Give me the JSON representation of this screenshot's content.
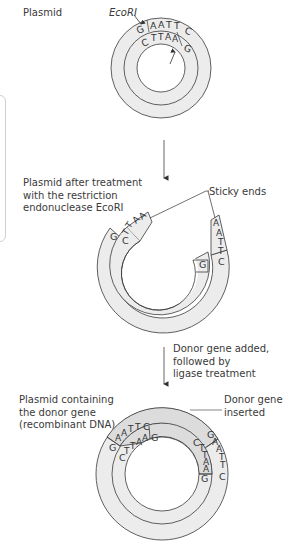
{
  "figure": {
    "step1": {
      "label": "Plasmid",
      "enzyme_top": "EcoRI",
      "enzyme_inner": "EcoRI",
      "outer_strand": [
        "G",
        "A",
        "A",
        "T",
        "T",
        "C"
      ],
      "inner_strand": [
        "C",
        "T",
        "T",
        "A",
        "A",
        "G"
      ]
    },
    "step2": {
      "label_lines": [
        "Plasmid after treatment",
        "with the restriction",
        "endonuclease EcoRI"
      ],
      "callout": "Sticky ends",
      "left_end_outer": "G",
      "left_end_inner": [
        "C",
        "T",
        "T",
        "A",
        "A"
      ],
      "right_end_outer": [
        "A",
        "A",
        "T",
        "T",
        "C"
      ],
      "right_end_inner": "G"
    },
    "arrow2_label_lines": [
      "Donor gene added,",
      "followed by",
      "ligase treatment"
    ],
    "step3": {
      "label_lines": [
        "Plasmid containing",
        "the donor gene",
        "(recombinant DNA)"
      ],
      "callout_lines": [
        "Donor gene",
        "inserted"
      ],
      "left_outer": [
        "G",
        "A",
        "A",
        "T",
        "T",
        "C"
      ],
      "left_inner": [
        "C",
        "T",
        "T",
        "A",
        "A",
        "G"
      ],
      "right_outer": [
        "G",
        "A",
        "A",
        "T",
        "T",
        "C"
      ],
      "right_inner": [
        "C",
        "T",
        "T",
        "A",
        "A",
        "G"
      ]
    },
    "colors": {
      "ring_fill": "#ececec",
      "donor_fill": "#dcdcdc",
      "stroke": "#3a3a3a"
    }
  }
}
